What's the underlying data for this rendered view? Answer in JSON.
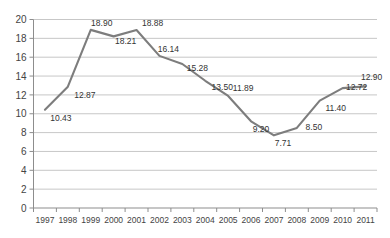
{
  "chart_data": {
    "type": "line",
    "title": "",
    "subtitle": "",
    "xlabel": "",
    "ylabel": "",
    "categories": [
      "1997",
      "1998",
      "1999",
      "2000",
      "2001",
      "2002",
      "2003",
      "2004",
      "2005",
      "2006",
      "2007",
      "2008",
      "2009",
      "2010",
      "2011"
    ],
    "values": [
      10.43,
      12.87,
      18.9,
      18.21,
      18.88,
      16.14,
      15.28,
      13.5,
      11.89,
      9.2,
      7.71,
      8.5,
      11.4,
      12.72,
      12.9
    ],
    "point_labels": [
      "10.43",
      "12.87",
      "18.90",
      "18.21",
      "18.88",
      "16.14",
      "15.28",
      "13.50",
      "11.89",
      "9.20",
      "7.71",
      "8.50",
      "11.40",
      "12.72",
      "12.90"
    ],
    "ylim": [
      0,
      20
    ],
    "ytick_values": [
      0,
      2,
      4,
      6,
      8,
      10,
      12,
      14,
      16,
      18,
      20
    ],
    "ytick_labels": [
      "0",
      "2",
      "4",
      "6",
      "8",
      "10",
      "12",
      "14",
      "16",
      "18",
      "20"
    ],
    "grid": true,
    "grid_axis": "y",
    "legend": false,
    "legend_position": "none",
    "series": [
      {
        "name": "",
        "color": "#7d7d7d",
        "values": [
          10.43,
          12.87,
          18.9,
          18.21,
          18.88,
          16.14,
          15.28,
          13.5,
          11.89,
          9.2,
          7.71,
          8.5,
          11.4,
          12.72,
          12.9
        ]
      }
    ],
    "colors": {
      "line": "#7d7d7d",
      "grid": "#b9b9b9",
      "axis": "#8d8d8d",
      "text": "#3a3a3a",
      "background": "#ffffff"
    },
    "label_offsets": [
      {
        "dx": 16,
        "dy": 11
      },
      {
        "dx": 17,
        "dy": 11
      },
      {
        "dx": 11,
        "dy": -4
      },
      {
        "dx": 12,
        "dy": 8
      },
      {
        "dx": 16,
        "dy": -4
      },
      {
        "dx": 9,
        "dy": -4
      },
      {
        "dx": 15,
        "dy": 7
      },
      {
        "dx": 17,
        "dy": 9
      },
      {
        "dx": 15,
        "dy": -5
      },
      {
        "dx": 10,
        "dy": 11
      },
      {
        "dx": 9,
        "dy": 11
      },
      {
        "dx": 17,
        "dy": 2
      },
      {
        "dx": 16,
        "dy": 10
      },
      {
        "dx": 14,
        "dy": 2
      },
      {
        "dx": 6,
        "dy": -6
      }
    ]
  }
}
